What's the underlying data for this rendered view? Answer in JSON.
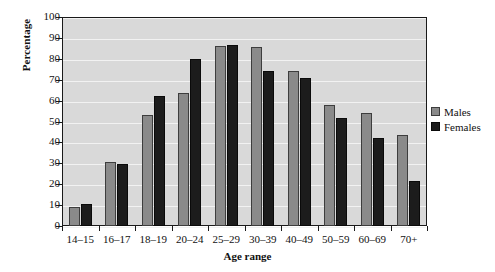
{
  "chart_data": {
    "type": "bar",
    "title": "",
    "xlabel": "Age range",
    "ylabel": "Percentage",
    "categories": [
      "14–15",
      "16–17",
      "18–19",
      "20–24",
      "25–29",
      "30–39",
      "40–49",
      "50–59",
      "60–69",
      "70+"
    ],
    "series": [
      {
        "name": "Males",
        "color": "#8a8a8a",
        "values": [
          9,
          30.5,
          53,
          63.5,
          86,
          85.5,
          74,
          58,
          54,
          43.5
        ]
      },
      {
        "name": "Females",
        "color": "#1c1c1c",
        "values": [
          10.5,
          29.5,
          62,
          80,
          86.5,
          74,
          71,
          51.5,
          42,
          21.5
        ]
      }
    ],
    "ylim": [
      0,
      100
    ],
    "yticks": [
      0,
      10,
      20,
      30,
      40,
      50,
      60,
      70,
      80,
      90,
      100
    ],
    "ytick_labels": [
      "0",
      "10",
      "20",
      "30",
      "40",
      "50",
      "60",
      "70",
      "80",
      "90",
      "100"
    ],
    "grid": true,
    "legend_position": "right",
    "plot_background": "#d9d9d9",
    "gridline_color": "#f2f2f2",
    "frame_color": "#1a1a1a"
  }
}
